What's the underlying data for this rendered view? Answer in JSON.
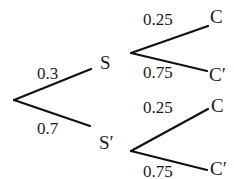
{
  "diagram": {
    "type": "probability-tree",
    "first_stage": {
      "upper": {
        "event": "S",
        "probability": "0.3"
      },
      "lower": {
        "event": "S′",
        "probability": "0.7"
      }
    },
    "second_stage": {
      "after_S": {
        "upper": {
          "event": "C",
          "probability": "0.25"
        },
        "lower": {
          "event": "C′",
          "probability": "0.75"
        }
      },
      "after_S_prime": {
        "upper": {
          "event": "C",
          "probability": "0.25"
        },
        "lower": {
          "event": "C′",
          "probability": "0.75"
        }
      }
    }
  }
}
